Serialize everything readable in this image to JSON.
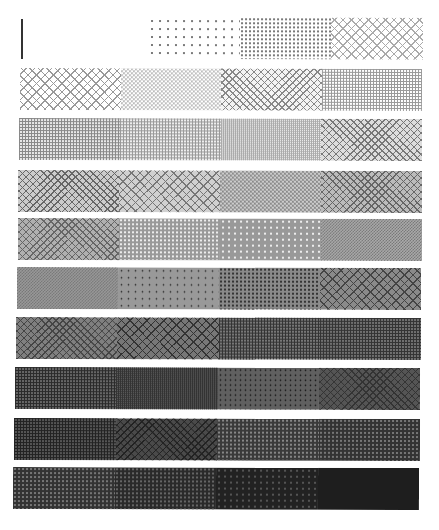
{
  "sheet": {
    "title": "",
    "background": "#ffffff",
    "marker": {
      "color": "#333333"
    }
  },
  "bands": [
    {
      "index": 0,
      "top": 17,
      "left": 148,
      "width": 275,
      "segments": [
        {
          "pattern": "dots",
          "fg": "#777777",
          "bg": "#ffffff",
          "size": "8px"
        },
        {
          "pattern": "dots",
          "fg": "#777777",
          "bg": "#ffffff",
          "size": "4px"
        },
        {
          "pattern": "cross",
          "fg": "#aaaaaa",
          "bg": "#ffffff",
          "size": "6px"
        }
      ]
    },
    {
      "index": 1,
      "top": 68,
      "left": 20,
      "width": 402,
      "segments": [
        {
          "pattern": "cross",
          "fg": "#999999",
          "bg": "#ffffff",
          "size": "6px"
        },
        {
          "pattern": "check",
          "fg": "#bbbbbb",
          "bg": "#ffffff",
          "size": "4px"
        },
        {
          "pattern": "cross",
          "fg": "#888888",
          "bg": "#f4f4f4",
          "size": "5px"
        },
        {
          "pattern": "grid",
          "fg": "#999999",
          "bg": "#ffffff",
          "size": "3px"
        }
      ]
    },
    {
      "index": 2,
      "top": 118,
      "left": 19,
      "width": 403,
      "segments": [
        {
          "pattern": "grid",
          "fg": "#888888",
          "bg": "#e8e8e8",
          "size": "3px"
        },
        {
          "pattern": "grid",
          "fg": "#999999",
          "bg": "#eeeeee",
          "size": "3px"
        },
        {
          "pattern": "grid",
          "fg": "#aaaaaa",
          "bg": "#ffffff",
          "size": "2px"
        },
        {
          "pattern": "cross",
          "fg": "#777777",
          "bg": "#dddddd",
          "size": "5px"
        }
      ]
    },
    {
      "index": 3,
      "top": 170,
      "left": 18,
      "width": 404,
      "segments": [
        {
          "pattern": "cross",
          "fg": "#666666",
          "bg": "#cccccc",
          "size": "5px"
        },
        {
          "pattern": "cross",
          "fg": "#777777",
          "bg": "#d0d0d0",
          "size": "6px"
        },
        {
          "pattern": "check",
          "fg": "#888888",
          "bg": "#cccccc",
          "size": "4px"
        },
        {
          "pattern": "cross",
          "fg": "#666666",
          "bg": "#bbbbbb",
          "size": "5px"
        }
      ]
    },
    {
      "index": 4,
      "top": 218,
      "left": 18,
      "width": 404,
      "segments": [
        {
          "pattern": "cross",
          "fg": "#666666",
          "bg": "#b0b0b0",
          "size": "5px"
        },
        {
          "pattern": "dots",
          "fg": "#eeeeee",
          "bg": "#999999",
          "size": "4px"
        },
        {
          "pattern": "dots",
          "fg": "#eeeeee",
          "bg": "#999999",
          "size": "6px"
        },
        {
          "pattern": "check",
          "fg": "#777777",
          "bg": "#aaaaaa",
          "size": "3px"
        }
      ]
    },
    {
      "index": 5,
      "top": 267,
      "left": 17,
      "width": 404,
      "segments": [
        {
          "pattern": "check",
          "fg": "#777777",
          "bg": "#999999",
          "size": "3px"
        },
        {
          "pattern": "dots",
          "fg": "#222222",
          "bg": "#999999",
          "size": "7px"
        },
        {
          "pattern": "dots",
          "fg": "#333333",
          "bg": "#8a8a8a",
          "size": "4px"
        },
        {
          "pattern": "cross",
          "fg": "#444444",
          "bg": "#8a8a8a",
          "size": "6px"
        }
      ]
    },
    {
      "index": 6,
      "top": 317,
      "left": 16,
      "width": 405,
      "segments": [
        {
          "pattern": "cross",
          "fg": "#444444",
          "bg": "#808080",
          "size": "5px"
        },
        {
          "pattern": "cross",
          "fg": "#333333",
          "bg": "#777777",
          "size": "6px"
        },
        {
          "pattern": "grid",
          "fg": "#333333",
          "bg": "#777777",
          "size": "3px"
        },
        {
          "pattern": "grid",
          "fg": "#333333",
          "bg": "#707070",
          "size": "3px"
        }
      ]
    },
    {
      "index": 7,
      "top": 367,
      "left": 15,
      "width": 405,
      "segments": [
        {
          "pattern": "grid",
          "fg": "#2a2a2a",
          "bg": "#666666",
          "size": "3px"
        },
        {
          "pattern": "grid",
          "fg": "#333333",
          "bg": "#666666",
          "size": "2px"
        },
        {
          "pattern": "dots",
          "fg": "#111111",
          "bg": "#606060",
          "size": "5px"
        },
        {
          "pattern": "cross",
          "fg": "#333333",
          "bg": "#555555",
          "size": "5px"
        }
      ]
    },
    {
      "index": 8,
      "top": 418,
      "left": 14,
      "width": 406,
      "segments": [
        {
          "pattern": "grid",
          "fg": "#222222",
          "bg": "#555555",
          "size": "3px"
        },
        {
          "pattern": "cross",
          "fg": "#222222",
          "bg": "#4a4a4a",
          "size": "5px"
        },
        {
          "pattern": "dots",
          "fg": "#888888",
          "bg": "#3a3a3a",
          "size": "4px"
        },
        {
          "pattern": "dots",
          "fg": "#777777",
          "bg": "#333333",
          "size": "4px"
        }
      ]
    },
    {
      "index": 9,
      "top": 467,
      "left": 13,
      "width": 406,
      "segments": [
        {
          "pattern": "dots",
          "fg": "#777777",
          "bg": "#333333",
          "size": "4px"
        },
        {
          "pattern": "dots",
          "fg": "#666666",
          "bg": "#2a2a2a",
          "size": "4px"
        },
        {
          "pattern": "dots",
          "fg": "#555555",
          "bg": "#222222",
          "size": "6px"
        },
        {
          "pattern": "solid",
          "fg": "#1e1e1e",
          "bg": "#1e1e1e",
          "size": "4px"
        }
      ]
    }
  ]
}
